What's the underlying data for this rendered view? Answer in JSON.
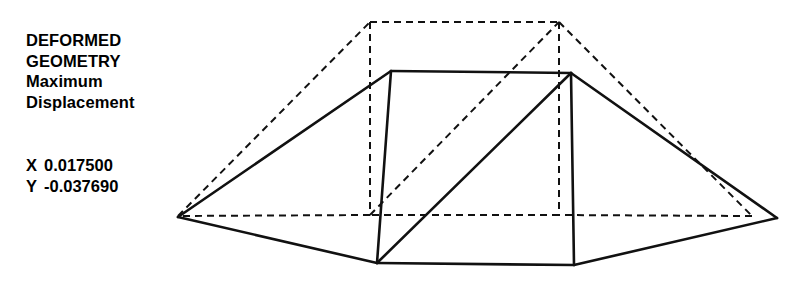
{
  "annotation": {
    "title_line_1": "DEFORMED",
    "title_line_2": "GEOMETRY",
    "subtitle_line_1": "Maximum",
    "subtitle_line_2": "Displacement"
  },
  "values": {
    "x_axis_tag": "X",
    "x_value": "0.017500",
    "y_axis_tag": "Y",
    "y_value": "-0.037690"
  },
  "style": {
    "line_color": "#111111",
    "background": "#ffffff",
    "solid_width": 2.6,
    "dashed_width": 2.0,
    "dash_pattern": "7,5"
  },
  "geometry": {
    "description": "Finite element wireframe: dashed undeformed outline overlaid with solid deformed outline",
    "deformed_solid": {
      "name": "deformed-geometry",
      "vertices": {
        "left_apex": [
          178,
          217
        ],
        "top_left": [
          391,
          71
        ],
        "top_right": [
          571,
          73
        ],
        "right_apex": [
          777,
          218
        ],
        "bottom_right": [
          574,
          265
        ],
        "bottom_left": [
          377,
          263
        ]
      },
      "edges": [
        [
          "left_apex",
          "top_left"
        ],
        [
          "top_left",
          "top_right"
        ],
        [
          "top_right",
          "right_apex"
        ],
        [
          "right_apex",
          "bottom_right"
        ],
        [
          "bottom_right",
          "bottom_left"
        ],
        [
          "bottom_left",
          "left_apex"
        ],
        [
          "top_left",
          "bottom_left"
        ],
        [
          "top_right",
          "bottom_right"
        ],
        [
          "bottom_left",
          "top_right"
        ]
      ]
    },
    "undeformed_dashed": {
      "name": "undeformed-geometry",
      "vertices": {
        "left_apex": [
          178,
          216
        ],
        "top_left": [
          370,
          22
        ],
        "top_right": [
          559,
          22
        ],
        "right_apex": [
          752,
          216
        ],
        "bottom_right": [
          559,
          215
        ],
        "bottom_left": [
          370,
          215
        ]
      },
      "edges": [
        [
          "left_apex",
          "top_left"
        ],
        [
          "top_left",
          "top_right"
        ],
        [
          "top_right",
          "right_apex"
        ],
        [
          "right_apex",
          "bottom_right"
        ],
        [
          "bottom_right",
          "bottom_left"
        ],
        [
          "bottom_left",
          "left_apex"
        ],
        [
          "top_left",
          "bottom_left"
        ],
        [
          "top_right",
          "bottom_right"
        ],
        [
          "bottom_left",
          "top_right"
        ]
      ]
    }
  }
}
